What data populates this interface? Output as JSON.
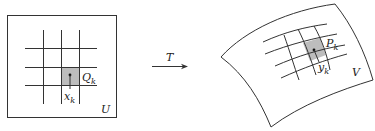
{
  "diagram": {
    "left_region": {
      "label": "U",
      "cell_label": "Q",
      "cell_label_sub": "k",
      "point_label": "x",
      "point_label_sub": "k"
    },
    "arrow": {
      "label": "T"
    },
    "right_region": {
      "label": "V",
      "cell_label": "P",
      "cell_label_sub": "k",
      "point_label": "y",
      "point_label_sub": "k"
    },
    "colors": {
      "stroke": "#333333",
      "cell_fill": "#bdbdbd",
      "background": "#ffffff"
    }
  }
}
